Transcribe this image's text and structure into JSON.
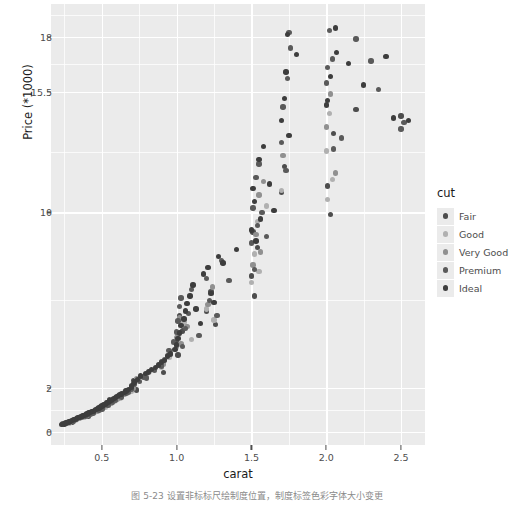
{
  "figure": {
    "caption": "图 5-23    设置非标标尺绘制度位置，制度标签色彩字体大小变更"
  },
  "axes": {
    "x": {
      "label": "carat",
      "ticks": [
        0.5,
        1.0,
        1.5,
        2.0,
        2.5
      ],
      "tick_labels": [
        "0.5",
        "1.0",
        "1.5",
        "2.0",
        "2.5"
      ],
      "range": [
        0.16,
        2.66
      ]
    },
    "y": {
      "label": "Price (*1000)",
      "ticks": [
        0,
        2,
        10,
        15.5,
        18
      ],
      "tick_labels": [
        "0",
        "2",
        "10",
        "15.5",
        "18"
      ],
      "range": [
        -0.6,
        19.5
      ]
    }
  },
  "legend": {
    "title": "cut",
    "position": "right",
    "items": [
      {
        "label": "Fair",
        "color": "#4d4d4d"
      },
      {
        "label": "Good",
        "color": "#b0b0b0"
      },
      {
        "label": "Very Good",
        "color": "#909090"
      },
      {
        "label": "Premium",
        "color": "#5a5a5a"
      },
      {
        "label": "Ideal",
        "color": "#3d3d3d"
      }
    ]
  },
  "style": {
    "panel_background": "#ebebeb",
    "grid_color": "#ffffff",
    "text_color": "#4d4d4d",
    "title_color": "#1a1a1a",
    "point_size": 5.4
  },
  "chart_data": {
    "type": "scatter",
    "title": "",
    "xlabel": "carat",
    "ylabel": "Price (*1000)",
    "xlim": [
      0.16,
      2.66
    ],
    "ylim": [
      -0.6,
      19.5
    ],
    "grid": true,
    "legend_position": "right",
    "legend_title": "cut",
    "series": [
      {
        "name": "Fair",
        "color": "#4d4d4d",
        "points": [
          [
            0.3,
            0.45
          ],
          [
            0.34,
            0.6
          ],
          [
            0.41,
            0.72
          ],
          [
            0.5,
            1.15
          ],
          [
            0.53,
            1.3
          ],
          [
            0.55,
            1.45
          ],
          [
            0.61,
            1.62
          ],
          [
            0.7,
            2.1
          ],
          [
            0.71,
            2.35
          ],
          [
            0.73,
            1.9
          ],
          [
            0.9,
            3.2
          ],
          [
            0.91,
            2.7
          ],
          [
            1.0,
            4.1
          ],
          [
            1.01,
            3.5
          ],
          [
            1.02,
            5.3
          ],
          [
            1.04,
            4.6
          ],
          [
            1.2,
            5.5
          ],
          [
            1.23,
            6.4
          ],
          [
            1.26,
            4.9
          ],
          [
            1.5,
            7.1
          ],
          [
            1.51,
            9.1
          ],
          [
            1.52,
            6.2
          ],
          [
            1.54,
            8.4
          ],
          [
            1.7,
            10.9
          ],
          [
            1.72,
            12.1
          ],
          [
            2.01,
            11.2
          ],
          [
            2.03,
            9.9
          ],
          [
            2.05,
            13.6
          ],
          [
            2.2,
            14.7
          ],
          [
            2.5,
            14.4
          ]
        ]
      },
      {
        "name": "Good",
        "color": "#b0b0b0",
        "points": [
          [
            0.28,
            0.4
          ],
          [
            0.32,
            0.52
          ],
          [
            0.38,
            0.68
          ],
          [
            0.45,
            0.88
          ],
          [
            0.52,
            1.1
          ],
          [
            0.58,
            1.38
          ],
          [
            0.62,
            1.55
          ],
          [
            0.7,
            1.85
          ],
          [
            0.72,
            2.25
          ],
          [
            0.8,
            2.6
          ],
          [
            0.9,
            2.95
          ],
          [
            0.95,
            3.4
          ],
          [
            1.0,
            3.85
          ],
          [
            1.01,
            4.4
          ],
          [
            1.05,
            5.0
          ],
          [
            1.1,
            4.2
          ],
          [
            1.2,
            5.6
          ],
          [
            1.25,
            5.1
          ],
          [
            1.5,
            6.8
          ],
          [
            1.52,
            8.1
          ],
          [
            1.54,
            9.6
          ],
          [
            1.55,
            7.3
          ],
          [
            1.6,
            10.3
          ],
          [
            1.7,
            11.0
          ],
          [
            2.0,
            12.8
          ],
          [
            2.01,
            10.6
          ],
          [
            2.02,
            14.5
          ],
          [
            2.04,
            11.5
          ]
        ]
      },
      {
        "name": "Very Good",
        "color": "#909090",
        "points": [
          [
            0.26,
            0.38
          ],
          [
            0.3,
            0.48
          ],
          [
            0.35,
            0.62
          ],
          [
            0.4,
            0.75
          ],
          [
            0.47,
            0.95
          ],
          [
            0.51,
            1.12
          ],
          [
            0.56,
            1.32
          ],
          [
            0.6,
            1.5
          ],
          [
            0.65,
            1.7
          ],
          [
            0.71,
            2.0
          ],
          [
            0.73,
            2.4
          ],
          [
            0.82,
            2.75
          ],
          [
            0.91,
            3.1
          ],
          [
            0.96,
            3.6
          ],
          [
            1.0,
            4.3
          ],
          [
            1.02,
            5.2
          ],
          [
            1.03,
            4.0
          ],
          [
            1.07,
            4.8
          ],
          [
            1.21,
            5.8
          ],
          [
            1.24,
            6.6
          ],
          [
            1.51,
            7.6
          ],
          [
            1.53,
            9.0
          ],
          [
            1.55,
            10.8
          ],
          [
            1.56,
            8.2
          ],
          [
            1.58,
            11.4
          ],
          [
            1.71,
            12.6
          ],
          [
            2.0,
            13.9
          ],
          [
            2.03,
            15.4
          ],
          [
            2.06,
            11.8
          ]
        ]
      },
      {
        "name": "Premium",
        "color": "#5a5a5a",
        "points": [
          [
            0.24,
            0.35
          ],
          [
            0.27,
            0.42
          ],
          [
            0.31,
            0.5
          ],
          [
            0.33,
            0.58
          ],
          [
            0.36,
            0.65
          ],
          [
            0.39,
            0.7
          ],
          [
            0.42,
            0.8
          ],
          [
            0.44,
            0.86
          ],
          [
            0.48,
            1.0
          ],
          [
            0.5,
            1.05
          ],
          [
            0.54,
            1.2
          ],
          [
            0.57,
            1.35
          ],
          [
            0.59,
            1.42
          ],
          [
            0.63,
            1.58
          ],
          [
            0.66,
            1.75
          ],
          [
            0.68,
            1.8
          ],
          [
            0.7,
            1.95
          ],
          [
            0.72,
            2.15
          ],
          [
            0.75,
            2.3
          ],
          [
            0.78,
            2.5
          ],
          [
            0.8,
            2.45
          ],
          [
            0.85,
            2.8
          ],
          [
            0.9,
            3.0
          ],
          [
            0.92,
            3.3
          ],
          [
            0.95,
            3.7
          ],
          [
            0.98,
            4.1
          ],
          [
            1.0,
            4.55
          ],
          [
            1.01,
            5.05
          ],
          [
            1.02,
            5.7
          ],
          [
            1.03,
            6.1
          ],
          [
            1.04,
            3.9
          ],
          [
            1.06,
            4.7
          ],
          [
            1.08,
            5.4
          ],
          [
            1.1,
            6.5
          ],
          [
            1.15,
            4.4
          ],
          [
            1.2,
            7.0
          ],
          [
            1.22,
            6.0
          ],
          [
            1.27,
            5.3
          ],
          [
            1.3,
            7.8
          ],
          [
            1.35,
            6.9
          ],
          [
            1.5,
            8.6
          ],
          [
            1.51,
            10.2
          ],
          [
            1.52,
            7.4
          ],
          [
            1.53,
            11.6
          ],
          [
            1.54,
            9.4
          ],
          [
            1.55,
            12.2
          ],
          [
            1.57,
            10.0
          ],
          [
            1.6,
            8.9
          ],
          [
            1.7,
            13.2
          ],
          [
            1.71,
            14.8
          ],
          [
            1.73,
            11.9
          ],
          [
            1.74,
            16.1
          ],
          [
            1.75,
            18.2
          ],
          [
            1.76,
            17.5
          ],
          [
            2.0,
            15.9
          ],
          [
            2.01,
            16.6
          ],
          [
            2.02,
            18.3
          ],
          [
            2.04,
            17.0
          ],
          [
            2.05,
            12.9
          ],
          [
            2.1,
            13.4
          ],
          [
            2.2,
            17.9
          ],
          [
            2.3,
            16.9
          ],
          [
            2.35,
            15.6
          ],
          [
            2.5,
            13.8
          ],
          [
            2.52,
            14.1
          ]
        ]
      },
      {
        "name": "Ideal",
        "color": "#3d3d3d",
        "points": [
          [
            0.23,
            0.33
          ],
          [
            0.25,
            0.36
          ],
          [
            0.26,
            0.41
          ],
          [
            0.28,
            0.44
          ],
          [
            0.29,
            0.47
          ],
          [
            0.3,
            0.51
          ],
          [
            0.31,
            0.55
          ],
          [
            0.32,
            0.57
          ],
          [
            0.33,
            0.61
          ],
          [
            0.34,
            0.64
          ],
          [
            0.35,
            0.66
          ],
          [
            0.36,
            0.69
          ],
          [
            0.37,
            0.72
          ],
          [
            0.38,
            0.74
          ],
          [
            0.39,
            0.78
          ],
          [
            0.4,
            0.82
          ],
          [
            0.41,
            0.85
          ],
          [
            0.42,
            0.88
          ],
          [
            0.43,
            0.92
          ],
          [
            0.44,
            0.94
          ],
          [
            0.45,
            0.98
          ],
          [
            0.46,
            1.02
          ],
          [
            0.47,
            1.06
          ],
          [
            0.48,
            1.09
          ],
          [
            0.49,
            1.13
          ],
          [
            0.5,
            1.18
          ],
          [
            0.51,
            1.22
          ],
          [
            0.52,
            1.26
          ],
          [
            0.53,
            1.31
          ],
          [
            0.54,
            1.34
          ],
          [
            0.55,
            1.4
          ],
          [
            0.56,
            1.44
          ],
          [
            0.57,
            1.48
          ],
          [
            0.58,
            1.52
          ],
          [
            0.59,
            1.56
          ],
          [
            0.6,
            1.6
          ],
          [
            0.61,
            1.65
          ],
          [
            0.62,
            1.69
          ],
          [
            0.63,
            1.73
          ],
          [
            0.65,
            1.8
          ],
          [
            0.66,
            1.86
          ],
          [
            0.68,
            1.92
          ],
          [
            0.7,
            2.05
          ],
          [
            0.71,
            2.2
          ],
          [
            0.72,
            2.28
          ],
          [
            0.74,
            2.38
          ],
          [
            0.76,
            2.55
          ],
          [
            0.79,
            2.65
          ],
          [
            0.81,
            2.72
          ],
          [
            0.83,
            2.85
          ],
          [
            0.86,
            2.92
          ],
          [
            0.88,
            3.05
          ],
          [
            0.9,
            3.15
          ],
          [
            0.92,
            3.25
          ],
          [
            0.94,
            3.45
          ],
          [
            0.96,
            3.55
          ],
          [
            0.99,
            3.75
          ],
          [
            1.0,
            3.95
          ],
          [
            1.01,
            4.25
          ],
          [
            1.02,
            4.5
          ],
          [
            1.03,
            4.85
          ],
          [
            1.05,
            5.15
          ],
          [
            1.06,
            5.5
          ],
          [
            1.07,
            5.85
          ],
          [
            1.09,
            6.2
          ],
          [
            1.11,
            6.7
          ],
          [
            1.13,
            5.6
          ],
          [
            1.16,
            4.95
          ],
          [
            1.18,
            7.2
          ],
          [
            1.21,
            7.5
          ],
          [
            1.23,
            6.3
          ],
          [
            1.25,
            5.9
          ],
          [
            1.28,
            8.0
          ],
          [
            1.31,
            7.7
          ],
          [
            1.4,
            8.3
          ],
          [
            1.5,
            9.2
          ],
          [
            1.51,
            11.1
          ],
          [
            1.52,
            10.5
          ],
          [
            1.53,
            8.7
          ],
          [
            1.55,
            12.4
          ],
          [
            1.56,
            9.7
          ],
          [
            1.58,
            13.0
          ],
          [
            1.62,
            11.3
          ],
          [
            1.65,
            10.1
          ],
          [
            1.7,
            14.2
          ],
          [
            1.72,
            15.2
          ],
          [
            1.73,
            16.4
          ],
          [
            1.74,
            18.1
          ],
          [
            1.75,
            13.5
          ],
          [
            1.8,
            17.2
          ],
          [
            2.0,
            14.9
          ],
          [
            2.01,
            15.1
          ],
          [
            2.03,
            16.2
          ],
          [
            2.06,
            18.4
          ],
          [
            2.07,
            17.3
          ],
          [
            2.15,
            16.8
          ],
          [
            2.25,
            15.8
          ],
          [
            2.4,
            17.1
          ],
          [
            2.45,
            14.3
          ],
          [
            2.55,
            14.2
          ]
        ]
      }
    ]
  }
}
